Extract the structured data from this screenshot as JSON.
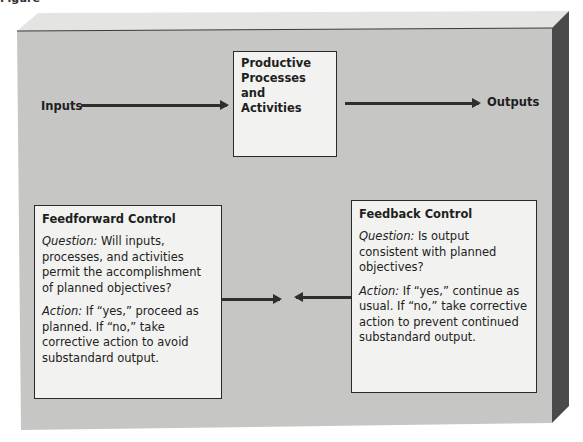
{
  "figure": {
    "label": "Figure"
  },
  "nodes": {
    "inputs": "Inputs",
    "outputs": "Outputs",
    "process": {
      "line1": "Productive",
      "line2": "Processes and",
      "line3": "Activities"
    }
  },
  "feedforward": {
    "title": "Feedforward Control",
    "question_label": "Question:",
    "question_text": " Will inputs, processes, and activities permit the accomplishment of planned objectives?",
    "action_label": "Action:",
    "action_text": " If “yes,” proceed as planned. If “no,” take corrective action to avoid substandard output."
  },
  "feedback": {
    "title": "Feedback Control",
    "question_label": "Question:",
    "question_text": " Is output consistent with planned objectives?",
    "action_label": "Action:",
    "action_text": " If “yes,” continue as usual. If “no,” take corrective action to prevent continued substandard output."
  },
  "colors": {
    "panel_front": "#c6c6c4",
    "panel_top": "#e4e4e2",
    "panel_side": "#4a4a4a",
    "box_fill": "#f2f2f0",
    "ink": "#2e2e2e"
  }
}
